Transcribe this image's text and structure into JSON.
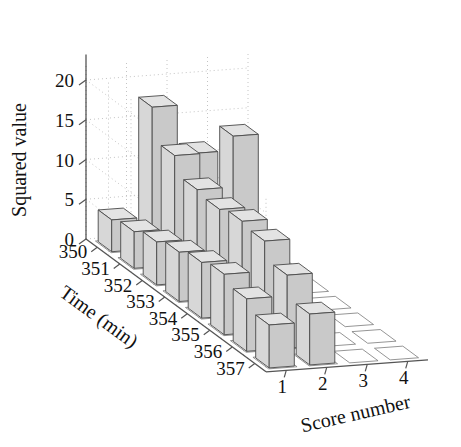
{
  "chart_data": {
    "type": "bar",
    "subtype": "bar3",
    "title": "",
    "xlabel": "Score number",
    "ylabel": "Time (min)",
    "zlabel": "Squared value",
    "x_categories": [
      "1",
      "2",
      "3",
      "4"
    ],
    "y_categories": [
      "350",
      "351",
      "352",
      "353",
      "354",
      "355",
      "356",
      "357"
    ],
    "z_ticks": [
      "0",
      "5",
      "10",
      "15",
      "20"
    ],
    "zlim": [
      0,
      22
    ],
    "grid": true,
    "legend": "none",
    "series": [
      {
        "name": "1",
        "values": [
          4.0,
          4.6,
          5.4,
          6.2,
          7.0,
          7.6,
          6.6,
          5.4
        ]
      },
      {
        "name": "2",
        "values": [
          17.8,
          13.8,
          11.6,
          11.2,
          11.8,
          11.4,
          9.2,
          6.4
        ]
      },
      {
        "name": "3",
        "values": [
          11.6,
          0,
          0,
          0,
          0,
          0,
          0,
          0
        ]
      },
      {
        "name": "4",
        "values": [
          13.4,
          0,
          0,
          0,
          0,
          0,
          0,
          0
        ]
      }
    ],
    "bar_color": "#d8d8d8",
    "edge_color": "#4a4a4a"
  },
  "axes": {
    "z_title": "Squared value",
    "y_title": "Time (min)",
    "x_title": "Score number"
  }
}
